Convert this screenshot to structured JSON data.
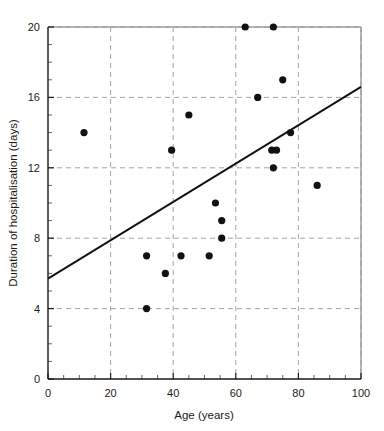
{
  "chart_data": {
    "type": "scatter",
    "title": "",
    "xlabel": "Age (years)",
    "ylabel": "Duration of hospitalisation (days)",
    "xlim": [
      0,
      100
    ],
    "ylim": [
      0,
      20
    ],
    "xticks": [
      0,
      20,
      40,
      60,
      80,
      100
    ],
    "yticks": [
      0,
      4,
      8,
      12,
      16,
      20
    ],
    "xtick_labels": [
      "0",
      "20",
      "40",
      "60",
      "80",
      "100"
    ],
    "ytick_labels": [
      "0",
      "4",
      "8",
      "12",
      "16",
      "20"
    ],
    "x_minor_tick_step": 5,
    "y_minor_tick_step": 1,
    "grid": true,
    "grid_style": "dashed",
    "grid_axes": "both",
    "legend": "none",
    "marker": "filled-circle",
    "marker_color": "#111111",
    "points": [
      {
        "x": 11.5,
        "y": 14
      },
      {
        "x": 31.5,
        "y": 7
      },
      {
        "x": 31.5,
        "y": 4
      },
      {
        "x": 37.5,
        "y": 6
      },
      {
        "x": 39.5,
        "y": 13
      },
      {
        "x": 42.5,
        "y": 7
      },
      {
        "x": 45,
        "y": 15
      },
      {
        "x": 51.5,
        "y": 7
      },
      {
        "x": 53.5,
        "y": 10
      },
      {
        "x": 55.5,
        "y": 9
      },
      {
        "x": 55.5,
        "y": 8
      },
      {
        "x": 63,
        "y": 20
      },
      {
        "x": 67,
        "y": 16
      },
      {
        "x": 71.5,
        "y": 13
      },
      {
        "x": 73,
        "y": 13
      },
      {
        "x": 72,
        "y": 20
      },
      {
        "x": 72,
        "y": 12
      },
      {
        "x": 75,
        "y": 17
      },
      {
        "x": 77.5,
        "y": 14
      },
      {
        "x": 86,
        "y": 11
      }
    ],
    "trendline": {
      "type": "linear-fit",
      "x_start": 0,
      "y_start": 5.7,
      "x_end": 100,
      "y_end": 16.6,
      "color": "#111111"
    }
  },
  "figure": {
    "background_color": "#ffffff",
    "frame_color": "#6e6e6e",
    "axis_color": "#1a1a1a",
    "grid_color": "#9a9a9a"
  }
}
